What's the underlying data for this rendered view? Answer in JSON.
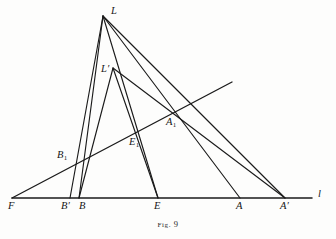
{
  "figure": {
    "caption_prefix": "Fig.",
    "caption_number": "9",
    "line_label": "l",
    "background_color": "#fdfdfc",
    "ink_color": "#1b1b1b"
  },
  "points": [
    {
      "id": "F",
      "label": "F",
      "label_html": "F",
      "x": 12,
      "y": 198,
      "label_x": 8,
      "label_y": 201
    },
    {
      "id": "Bp",
      "label": "B'",
      "label_html": "B&#8242;",
      "x": 70,
      "y": 198,
      "label_x": 61,
      "label_y": 201
    },
    {
      "id": "B",
      "label": "B",
      "label_html": "B",
      "x": 79,
      "y": 198,
      "label_x": 79,
      "label_y": 201
    },
    {
      "id": "E",
      "label": "E",
      "label_html": "E",
      "x": 158,
      "y": 198,
      "label_x": 154,
      "label_y": 201
    },
    {
      "id": "A",
      "label": "A",
      "label_html": "A",
      "x": 240,
      "y": 198,
      "label_x": 236,
      "label_y": 201
    },
    {
      "id": "Ap",
      "label": "A'",
      "label_html": "A&#8242;",
      "x": 285,
      "y": 198,
      "label_x": 280,
      "label_y": 201
    },
    {
      "id": "L",
      "label": "L",
      "label_html": "L",
      "x": 103,
      "y": 16,
      "label_x": 111,
      "label_y": 6
    },
    {
      "id": "Lp",
      "label": "L'",
      "label_html": "L&#8242;",
      "x": 113,
      "y": 68,
      "label_x": 101,
      "label_y": 64
    },
    {
      "id": "B1",
      "label": "B₁",
      "label_html": "B<sub>1</sub>",
      "x": 79,
      "y": 160,
      "label_x": 57,
      "label_y": 150
    },
    {
      "id": "E1",
      "label": "E₁",
      "label_html": "E<sub>1</sub>",
      "x": 138,
      "y": 134,
      "label_x": 129,
      "label_y": 137
    },
    {
      "id": "A1",
      "label": "A₁",
      "label_html": "A<sub>1</sub>",
      "x": 178,
      "y": 109,
      "label_x": 166,
      "label_y": 117
    }
  ],
  "segments": [
    {
      "name": "baseline-l",
      "from": [
        12,
        198
      ],
      "to": [
        312,
        198
      ],
      "kind": "base"
    },
    {
      "name": "transversal-F-A1",
      "from": [
        12,
        198
      ],
      "to": [
        232,
        82
      ],
      "kind": "transversal"
    },
    {
      "name": "L-to-Bprime",
      "from": [
        103,
        16
      ],
      "to": [
        70,
        198
      ],
      "kind": "ray"
    },
    {
      "name": "L-to-E1-E",
      "from": [
        103,
        16
      ],
      "to": [
        158,
        198
      ],
      "kind": "ray"
    },
    {
      "name": "L-to-A1-A",
      "from": [
        103,
        16
      ],
      "to": [
        240,
        198
      ],
      "kind": "ray"
    },
    {
      "name": "L-to-Aprime",
      "from": [
        103,
        16
      ],
      "to": [
        285,
        198
      ],
      "kind": "ray"
    },
    {
      "name": "Lprime-to-B1-B",
      "from": [
        113,
        68
      ],
      "to": [
        79,
        198
      ],
      "kind": "ray"
    },
    {
      "name": "Lprime-to-E",
      "from": [
        113,
        68
      ],
      "to": [
        158,
        198
      ],
      "kind": "ray"
    },
    {
      "name": "Lprime-to-A1-Aprime",
      "from": [
        113,
        68
      ],
      "to": [
        285,
        198
      ],
      "kind": "ray"
    },
    {
      "name": "L-to-Lprime-B",
      "from": [
        103,
        16
      ],
      "to": [
        79,
        198
      ],
      "kind": "ray"
    }
  ],
  "labels": {
    "line_l_x": 318,
    "line_l_y": 189
  }
}
